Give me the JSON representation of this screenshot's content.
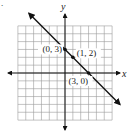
{
  "chart_data": {
    "type": "line",
    "title": "",
    "xlabel": "x",
    "ylabel": "y",
    "xlim": [
      -6,
      6
    ],
    "ylim": [
      -6,
      6
    ],
    "grid": true,
    "grid_step": 1,
    "series": [
      {
        "name": "y = -x + 3",
        "slope": -1,
        "intercept": 3,
        "x": [
          -4.6,
          7
        ],
        "y": [
          7.6,
          -4
        ],
        "arrows": "both"
      }
    ],
    "points": [
      {
        "x": 0,
        "y": 3,
        "label": "(0, 3)",
        "label_pos": "left"
      },
      {
        "x": 1,
        "y": 2,
        "label": "(1, 2)",
        "label_pos": "right"
      },
      {
        "x": 3,
        "y": 0,
        "label": "(3, 0)",
        "label_pos": "below"
      }
    ]
  },
  "marker": "."
}
